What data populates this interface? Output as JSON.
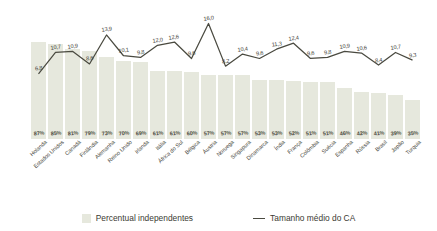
{
  "chart_data": {
    "type": "bar",
    "title": "",
    "xlabel": "",
    "ylabel": "",
    "grid": false,
    "legend_position": "bottom",
    "categories": [
      "Holanda",
      "Estados Unidos",
      "Canadá",
      "Finlândia",
      "Alemanha",
      "Reino Unido",
      "Irlanda",
      "Itália",
      "África do Sul",
      "Bélgica",
      "Áustria",
      "Noruega",
      "Singapura",
      "Dinamarca",
      "Índia",
      "França",
      "Colômbia",
      "Suécia",
      "Espanha",
      "Rússia",
      "Brasil",
      "Japão",
      "Turquia"
    ],
    "series": [
      {
        "name": "Percentual independentes",
        "type": "bar",
        "unit": "%",
        "values": [
          87,
          85,
          81,
          79,
          73,
          70,
          69,
          61,
          61,
          60,
          57,
          57,
          57,
          53,
          53,
          52,
          51,
          51,
          46,
          42,
          41,
          39,
          35
        ],
        "labels": [
          "87%",
          "85%",
          "81%",
          "79%",
          "73%",
          "70%",
          "69%",
          "61%",
          "61%",
          "60%",
          "57%",
          "57%",
          "57%",
          "53%",
          "53%",
          "52%",
          "51%",
          "51%",
          "46%",
          "42%",
          "41%",
          "39%",
          "35%"
        ],
        "color": "#e6e8dd",
        "ylim": [
          0,
          100
        ]
      },
      {
        "name": "Tamanho médio do CA",
        "type": "line",
        "values": [
          6.8,
          10.7,
          10.9,
          8.6,
          13.9,
          10.1,
          9.8,
          12.0,
          12.6,
          9.6,
          16.0,
          8.2,
          10.4,
          9.6,
          11.3,
          12.4,
          9.6,
          9.8,
          10.9,
          10.6,
          8.4,
          10.7,
          9.3
        ],
        "labels": [
          "6,8",
          "10,7",
          "10,9",
          "8,6",
          "13,9",
          "10,1",
          "9,8",
          "12,0",
          "12,6",
          "9,6",
          "16,0",
          "8,2",
          "10,4",
          "9,6",
          "11,3",
          "12,4",
          "9,6",
          "9,8",
          "10,9",
          "10,6",
          "8,4",
          "10,7",
          "9,3"
        ],
        "color": "#4a4a40",
        "ylim": [
          0,
          17
        ]
      }
    ]
  },
  "legend": {
    "items": [
      {
        "label": "Percentual independentes",
        "marker": "swatch",
        "color": "#e6e8dd"
      },
      {
        "label": "Tamanho médio do CA",
        "marker": "line",
        "color": "#4a4a40"
      }
    ]
  }
}
